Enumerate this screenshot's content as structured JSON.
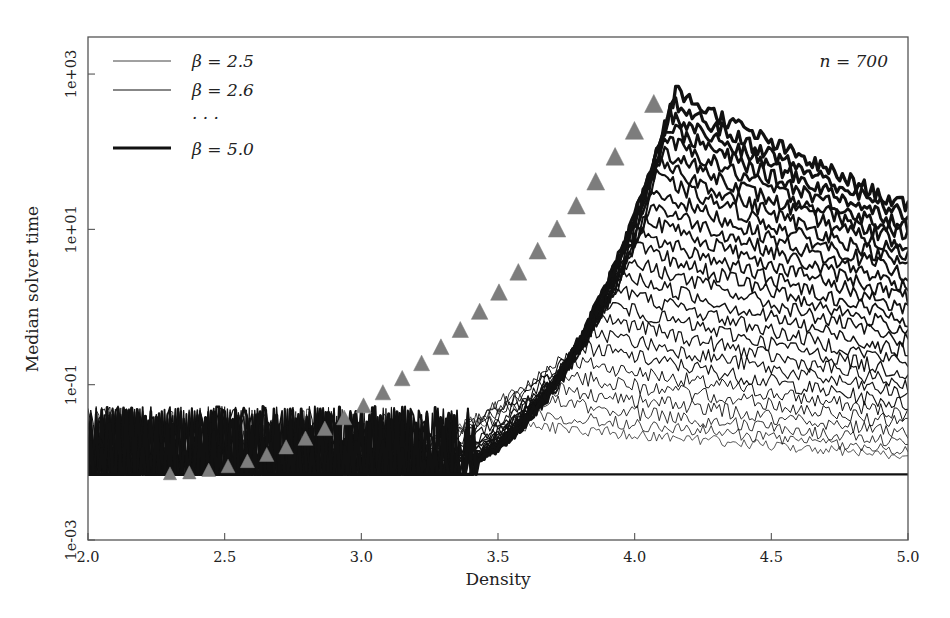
{
  "figure": {
    "background_color": "#ffffff",
    "frame_color": "#555555",
    "curve_color": "#111111",
    "marker_color": "#7d7d7d"
  },
  "annotation": {
    "n_label": "n = 700"
  },
  "legend": {
    "entries": [
      {
        "label": "β = 2.5",
        "width": 0.7
      },
      {
        "label": "β = 2.6",
        "width": 0.9
      },
      {
        "label": "· · ·",
        "width": 0
      },
      {
        "label": "β = 5.0",
        "width": 3.2
      }
    ],
    "ellipsis": "· · ·"
  },
  "chart_data": {
    "type": "line",
    "title": "",
    "xlabel": "Density",
    "ylabel": "Median solver time",
    "xlim": [
      2.0,
      5.0
    ],
    "ylim": [
      0.001,
      3000
    ],
    "yscale": "log",
    "xticks": [
      2.0,
      2.5,
      3.0,
      3.5,
      4.0,
      4.5,
      5.0
    ],
    "xticklabels": [
      "2.0",
      "2.5",
      "3.0",
      "3.5",
      "4.0",
      "4.5",
      "5.0"
    ],
    "yticks": [
      1000,
      10,
      0.1,
      0.001
    ],
    "yticklabels": [
      "1e+03",
      "1e+01",
      "1e-01",
      "1e-03"
    ],
    "grid": false,
    "legend_position": "top-left",
    "annotations": [
      {
        "text": "n = 700",
        "x": 4.85,
        "y": 1200
      }
    ],
    "resolution_floor": 0.007,
    "series_parameter": "β",
    "series_parameter_values": [
      2.5,
      2.6,
      2.7,
      2.8,
      2.9,
      3.0,
      3.1,
      3.2,
      3.3,
      3.4,
      3.5,
      3.6,
      3.7,
      3.8,
      3.9,
      4.0,
      4.1,
      4.2,
      4.3,
      4.4,
      4.5,
      4.6,
      4.7,
      4.8,
      4.9,
      5.0
    ],
    "series": [
      {
        "name": "β = 2.5",
        "peak_x": 3.42,
        "peak_y": 0.035,
        "end_y": 0.012,
        "linewidth": 0.7
      },
      {
        "name": "β = 2.6",
        "peak_x": 3.48,
        "peak_y": 0.05,
        "end_y": 0.014,
        "linewidth": 0.8
      },
      {
        "name": "β = 2.7",
        "peak_x": 3.54,
        "peak_y": 0.07,
        "end_y": 0.018,
        "linewidth": 0.85
      },
      {
        "name": "β = 2.8",
        "peak_x": 3.6,
        "peak_y": 0.1,
        "end_y": 0.024,
        "linewidth": 0.9
      },
      {
        "name": "β = 2.9",
        "peak_x": 3.66,
        "peak_y": 0.15,
        "end_y": 0.032,
        "linewidth": 0.95
      },
      {
        "name": "β = 3.0",
        "peak_x": 3.72,
        "peak_y": 0.22,
        "end_y": 0.042,
        "linewidth": 1.0
      },
      {
        "name": "β = 3.1",
        "peak_x": 3.78,
        "peak_y": 0.33,
        "end_y": 0.055,
        "linewidth": 1.1
      },
      {
        "name": "β = 3.2",
        "peak_x": 3.83,
        "peak_y": 0.5,
        "end_y": 0.075,
        "linewidth": 1.15
      },
      {
        "name": "β = 3.3",
        "peak_x": 3.87,
        "peak_y": 0.75,
        "end_y": 0.1,
        "linewidth": 1.2
      },
      {
        "name": "β = 3.4",
        "peak_x": 3.9,
        "peak_y": 1.1,
        "end_y": 0.14,
        "linewidth": 1.3
      },
      {
        "name": "β = 3.5",
        "peak_x": 3.93,
        "peak_y": 1.7,
        "end_y": 0.19,
        "linewidth": 1.35
      },
      {
        "name": "β = 3.6",
        "peak_x": 3.96,
        "peak_y": 2.6,
        "end_y": 0.26,
        "linewidth": 1.45
      },
      {
        "name": "β = 3.7",
        "peak_x": 3.98,
        "peak_y": 4.0,
        "end_y": 0.36,
        "linewidth": 1.5
      },
      {
        "name": "β = 3.8",
        "peak_x": 4.0,
        "peak_y": 6.0,
        "end_y": 0.5,
        "linewidth": 1.6
      },
      {
        "name": "β = 3.9",
        "peak_x": 4.02,
        "peak_y": 9.0,
        "end_y": 0.68,
        "linewidth": 1.7
      },
      {
        "name": "β = 4.0",
        "peak_x": 4.04,
        "peak_y": 14.0,
        "end_y": 0.95,
        "linewidth": 1.8
      },
      {
        "name": "β = 4.1",
        "peak_x": 4.06,
        "peak_y": 21.0,
        "end_y": 1.3,
        "linewidth": 1.9
      },
      {
        "name": "β = 4.2",
        "peak_x": 4.07,
        "peak_y": 32.0,
        "end_y": 1.8,
        "linewidth": 2.0
      },
      {
        "name": "β = 4.3",
        "peak_x": 4.08,
        "peak_y": 48.0,
        "end_y": 2.5,
        "linewidth": 2.1
      },
      {
        "name": "β = 4.4",
        "peak_x": 4.09,
        "peak_y": 70.0,
        "end_y": 3.4,
        "linewidth": 2.2
      },
      {
        "name": "β = 4.5",
        "peak_x": 4.1,
        "peak_y": 105.0,
        "end_y": 4.6,
        "linewidth": 2.4
      },
      {
        "name": "β = 4.6",
        "peak_x": 4.11,
        "peak_y": 150.0,
        "end_y": 6.2,
        "linewidth": 2.5
      },
      {
        "name": "β = 4.7",
        "peak_x": 4.12,
        "peak_y": 215.0,
        "end_y": 8.3,
        "linewidth": 2.7
      },
      {
        "name": "β = 4.8",
        "peak_x": 4.13,
        "peak_y": 300.0,
        "end_y": 11.0,
        "linewidth": 2.9
      },
      {
        "name": "β = 4.9",
        "peak_x": 4.14,
        "peak_y": 420.0,
        "end_y": 14.5,
        "linewidth": 3.1
      },
      {
        "name": "β = 5.0",
        "peak_x": 4.15,
        "peak_y": 600.0,
        "end_y": 19.0,
        "linewidth": 3.3
      }
    ],
    "marker_style": "triangle-up",
    "marker_color": "#7d7d7d",
    "markers_description": "Gray up-triangles mark the 50% satisfiability crossing point of each curve, forming a diagonal ridge from (2.3, 0.007) up to (4.07, 400)."
  }
}
